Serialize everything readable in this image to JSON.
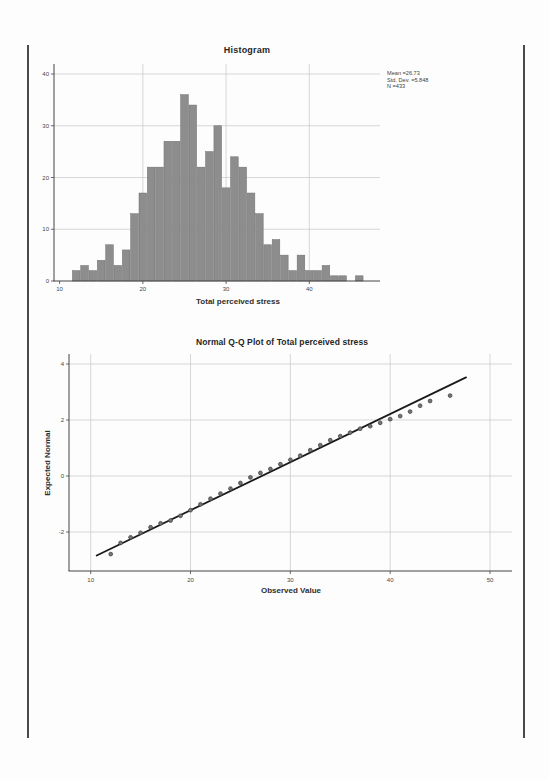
{
  "histogram": {
    "title": "Histogram",
    "xlabel": "Total perceived stress",
    "stats": [
      "Mean =26.73",
      "Std. Dev. =5.848",
      "N =433"
    ]
  },
  "qq": {
    "title": "Normal Q-Q Plot of Total perceived stress",
    "xlabel": "Observed Value",
    "ylabel": "Expected Normal"
  },
  "colors": {
    "bar_fill": "#8d8d8d",
    "bar_stroke": "#6d6d6d",
    "grid": "#c6c6c6",
    "axis": "#454545",
    "tick_text": "#454545",
    "qq_point_fill": "#757575",
    "qq_point_stroke": "#454545",
    "qq_line": "#1a1a1a",
    "page_edge": "#4a4a4a"
  },
  "chart_data": [
    {
      "type": "bar",
      "title": "Histogram",
      "xlabel": "Total perceived stress",
      "ylabel": "",
      "annotation": [
        "Mean =26.73",
        "Std. Dev. =5.848",
        "N =433"
      ],
      "bin_width": 1,
      "bin_centers": [
        12,
        13,
        14,
        15,
        16,
        17,
        18,
        19,
        20,
        21,
        22,
        23,
        24,
        25,
        26,
        27,
        28,
        29,
        30,
        31,
        32,
        33,
        34,
        35,
        36,
        37,
        38,
        39,
        40,
        41,
        42,
        43,
        44,
        45,
        46
      ],
      "values": [
        2,
        3,
        2,
        4,
        7,
        3,
        6,
        13,
        17,
        22,
        22,
        27,
        27,
        36,
        34,
        22,
        25,
        30,
        18,
        24,
        22,
        17,
        13,
        7,
        8,
        5,
        2,
        5,
        2,
        2,
        3,
        1,
        1,
        0,
        1
      ],
      "x_ticks": [
        10,
        20,
        30,
        40
      ],
      "y_ticks": [
        0,
        10,
        20,
        30,
        40
      ],
      "xlim": [
        9.3,
        48.5
      ],
      "ylim": [
        0,
        41.9
      ],
      "grid": true,
      "legend": "none"
    },
    {
      "type": "scatter",
      "title": "Normal Q-Q Plot of Total perceived stress",
      "xlabel": "Observed Value",
      "ylabel": "Expected Normal",
      "x_ticks": [
        10,
        20,
        30,
        40,
        50
      ],
      "y_ticks": [
        -2,
        0,
        2,
        4
      ],
      "xlim": [
        7.8,
        51.7
      ],
      "ylim": [
        -3.4,
        4.3
      ],
      "grid": true,
      "legend": "none",
      "points": [
        [
          12,
          -2.79
        ],
        [
          13,
          -2.39
        ],
        [
          14,
          -2.19
        ],
        [
          15,
          -2.03
        ],
        [
          16,
          -1.83
        ],
        [
          17,
          -1.69
        ],
        [
          18,
          -1.59
        ],
        [
          19,
          -1.42
        ],
        [
          20,
          -1.22
        ],
        [
          21,
          -1.01
        ],
        [
          22,
          -0.81
        ],
        [
          23,
          -0.63
        ],
        [
          24,
          -0.45
        ],
        [
          25,
          -0.25
        ],
        [
          26,
          -0.05
        ],
        [
          27,
          0.11
        ],
        [
          28,
          0.25
        ],
        [
          29,
          0.42
        ],
        [
          30,
          0.58
        ],
        [
          31,
          0.73
        ],
        [
          32,
          0.92
        ],
        [
          33,
          1.1
        ],
        [
          34,
          1.28
        ],
        [
          35,
          1.42
        ],
        [
          36,
          1.55
        ],
        [
          37,
          1.69
        ],
        [
          38,
          1.78
        ],
        [
          39,
          1.9
        ],
        [
          40,
          2.03
        ],
        [
          41,
          2.14
        ],
        [
          42,
          2.3
        ],
        [
          43,
          2.51
        ],
        [
          44,
          2.68
        ],
        [
          46,
          2.87
        ]
      ],
      "line": {
        "x1": 10.6,
        "y1": -2.84,
        "x2": 47.6,
        "y2": 3.52
      }
    }
  ]
}
